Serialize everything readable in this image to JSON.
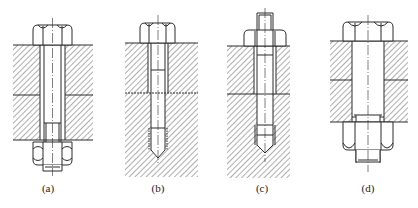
{
  "figure": {
    "type": "engineering-drawing",
    "line_color": "#2a2a2a",
    "background": "#ffffff",
    "panels": [
      {
        "id": "a",
        "label": "(a)",
        "kind": "through-bolt with nut"
      },
      {
        "id": "b",
        "label": "(b)",
        "kind": "screw into tapped hole"
      },
      {
        "id": "c",
        "label": "(c)",
        "kind": "stud with nut"
      },
      {
        "id": "d",
        "label": "(d)",
        "kind": "bolt in reamed hole with nut"
      }
    ]
  }
}
